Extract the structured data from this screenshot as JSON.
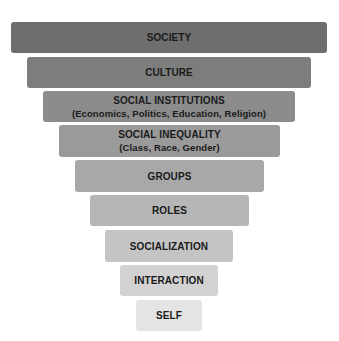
{
  "diagram": {
    "type": "inverted-pyramid",
    "levels": [
      {
        "label": "SOCIETY",
        "sublabel": "",
        "color": "#6e6e6e",
        "left": 11,
        "top": 22,
        "width": 316,
        "height": 31
      },
      {
        "label": "CULTURE",
        "sublabel": "",
        "color": "#7d7d7d",
        "left": 27,
        "top": 57,
        "width": 284,
        "height": 31
      },
      {
        "label": "SOCIAL INSTITUTIONS",
        "sublabel": "(Economics, Politics, Education, Religion)",
        "color": "#8c8c8c",
        "left": 43,
        "top": 91,
        "width": 252,
        "height": 31
      },
      {
        "label": "SOCIAL INEQUALITY",
        "sublabel": "(Class, Race, Gender)",
        "color": "#9a9a9a",
        "left": 59,
        "top": 125,
        "width": 221,
        "height": 32
      },
      {
        "label": "GROUPS",
        "sublabel": "",
        "color": "#a8a8a8",
        "left": 75,
        "top": 160,
        "width": 189,
        "height": 32
      },
      {
        "label": "ROLES",
        "sublabel": "",
        "color": "#b6b6b6",
        "left": 90,
        "top": 195,
        "width": 159,
        "height": 31
      },
      {
        "label": "SOCIALIZATION",
        "sublabel": "",
        "color": "#c4c4c4",
        "left": 105,
        "top": 230,
        "width": 128,
        "height": 32
      },
      {
        "label": "INTERACTION",
        "sublabel": "",
        "color": "#d2d2d2",
        "left": 120,
        "top": 265,
        "width": 98,
        "height": 31
      },
      {
        "label": "SELF",
        "sublabel": "",
        "color": "#e4e4e4",
        "left": 136,
        "top": 300,
        "width": 66,
        "height": 31
      }
    ]
  }
}
